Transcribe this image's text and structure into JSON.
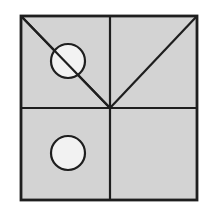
{
  "figure": {
    "background": "#ffffff",
    "square": {
      "x": 21,
      "y": 16,
      "width": 176,
      "height": 184,
      "fill": "#d3d3d3",
      "stroke": "#1e1e1e",
      "stroke_width": 2.2
    },
    "center": {
      "x": 110,
      "y": 108
    },
    "lines": [
      {
        "name": "vertical-divider",
        "x1": 110,
        "y1": 16,
        "x2": 110,
        "y2": 200
      },
      {
        "name": "horizontal-divider",
        "x1": 21,
        "y1": 108,
        "x2": 197,
        "y2": 108
      },
      {
        "name": "diagonal-top-left-to-center",
        "x1": 21,
        "y1": 16,
        "x2": 110,
        "y2": 108
      },
      {
        "name": "diagonal-top-right-to-center",
        "x1": 197,
        "y1": 16,
        "x2": 110,
        "y2": 108
      }
    ],
    "circles": [
      {
        "name": "circle-upper-left",
        "cx": 68,
        "cy": 61,
        "r": 17,
        "fill": "#f2f2f2"
      },
      {
        "name": "circle-lower-left",
        "cx": 68,
        "cy": 153,
        "r": 17,
        "fill": "#f2f2f2"
      }
    ],
    "line_color": "#1e1e1e"
  }
}
